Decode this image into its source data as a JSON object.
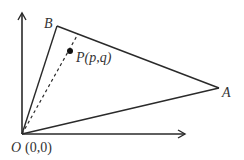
{
  "diagram": {
    "title": "",
    "colors": {
      "stroke": "#2a2a2a",
      "text": "#333333",
      "background": "#ffffff"
    },
    "origin": {
      "name": "O",
      "coord_label": "(0,0)"
    },
    "points": {
      "A": {
        "label": "A"
      },
      "B": {
        "label": "B"
      },
      "P": {
        "label": "P(p,q)",
        "letter": "P",
        "args": "(p,q)"
      }
    },
    "axes": {
      "x": "x-axis",
      "y": "y-axis"
    },
    "segments": [
      {
        "from": "O",
        "to": "A",
        "style": "solid"
      },
      {
        "from": "O",
        "to": "B",
        "style": "solid"
      },
      {
        "from": "A",
        "to": "B",
        "style": "solid"
      },
      {
        "from": "O",
        "to": "P",
        "style": "dashed",
        "extends_to": "AB"
      }
    ]
  }
}
